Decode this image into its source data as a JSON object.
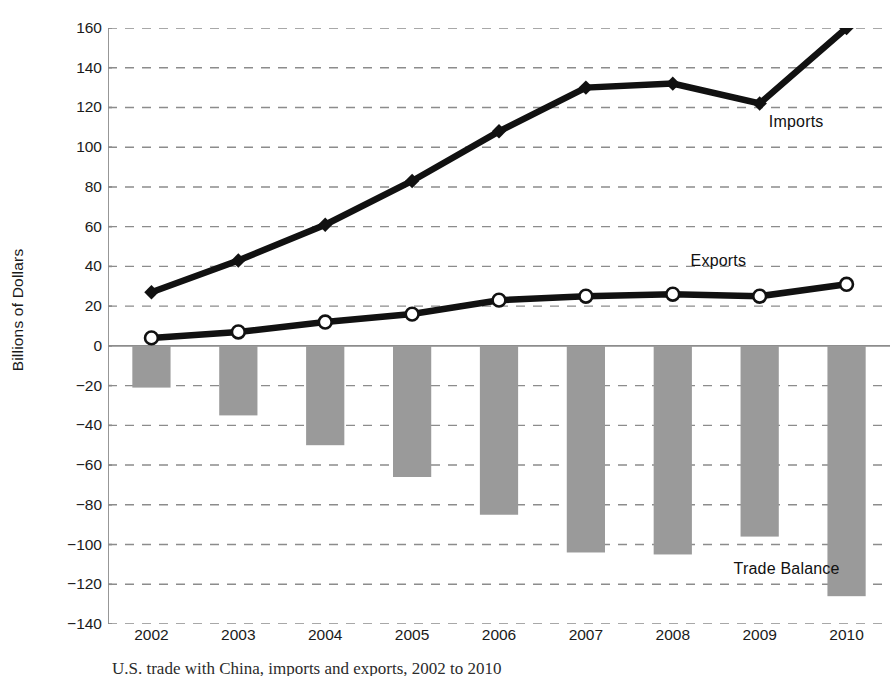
{
  "chart_data": {
    "type": "bar",
    "title": "",
    "xlabel": "",
    "ylabel": "Billions of Dollars",
    "categories": [
      "2002",
      "2003",
      "2004",
      "2005",
      "2006",
      "2007",
      "2008",
      "2009",
      "2010"
    ],
    "ylim": [
      -140,
      160
    ],
    "ytick_step": 20,
    "yticks": [
      "160",
      "140",
      "120",
      "100",
      "80",
      "60",
      "40",
      "20",
      "0",
      "-20",
      "-40",
      "-60",
      "-80",
      "-100",
      "-120",
      "-140"
    ],
    "grid": "horizontal-dashed",
    "legend": "inline-annotations",
    "series": [
      {
        "name": "Imports",
        "type": "line",
        "marker": "diamond-filled",
        "color": "#111111",
        "values": [
          27,
          43,
          61,
          83,
          108,
          130,
          132,
          122,
          160
        ]
      },
      {
        "name": "Exports",
        "type": "line",
        "marker": "circle-open",
        "color": "#111111",
        "values": [
          4,
          7,
          12,
          16,
          23,
          25,
          26,
          25,
          31
        ]
      },
      {
        "name": "Trade Balance",
        "type": "bar",
        "color": "#9a9a9a",
        "values": [
          -21,
          -35,
          -50,
          -66,
          -85,
          -104,
          -105,
          -96,
          -126
        ]
      }
    ],
    "annotations": [
      {
        "text": "Imports",
        "x_frac": 0.845,
        "y_value": 112
      },
      {
        "text": "Exports",
        "x_frac": 0.745,
        "y_value": 42
      },
      {
        "text": "Trade Balance",
        "x_frac": 0.8,
        "y_value": -113
      }
    ]
  },
  "caption": "U.S. trade with China, imports and exports, 2002 to 2010",
  "colors": {
    "bar_fill": "#9a9a9a",
    "line": "#111111",
    "marker_fill": "#ffffff",
    "axis": "#8c8c8c",
    "grid": "#8c8c8c",
    "text": "#1a1a1a"
  }
}
